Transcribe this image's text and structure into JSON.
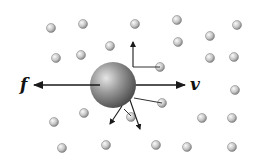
{
  "diagram": {
    "labels": {
      "force": "f",
      "velocity": "v"
    },
    "colors": {
      "background": "#ffffff",
      "arrow": "#1a1a1a",
      "big_particle_light": "#d8d8d8",
      "big_particle_dark": "#555555",
      "small_particle_light": "#f4f4f4",
      "small_particle_dark": "#8a8a8a"
    },
    "big_particle": {
      "cx": 113,
      "cy": 85,
      "r": 23
    },
    "force_arrow": {
      "x1": 100,
      "y1": 85,
      "x2": 34,
      "y2": 85
    },
    "velocity_arrow": {
      "x1": 136,
      "y1": 85,
      "x2": 185,
      "y2": 85
    },
    "collision_arrows": [
      {
        "x1": 133,
        "y1": 67,
        "x2": 133,
        "y2": 42
      },
      {
        "x1": 122,
        "y1": 106,
        "x2": 110,
        "y2": 124
      },
      {
        "x1": 130,
        "y1": 100,
        "x2": 140,
        "y2": 129
      }
    ],
    "collision_lines": [
      {
        "x1": 133,
        "y1": 67,
        "x2": 160,
        "y2": 67
      },
      {
        "x1": 134,
        "y1": 98,
        "x2": 162,
        "y2": 103
      },
      {
        "x1": 124,
        "y1": 109,
        "x2": 131,
        "y2": 116
      }
    ],
    "small_particles": [
      {
        "cx": 51,
        "cy": 28
      },
      {
        "cx": 83,
        "cy": 24
      },
      {
        "cx": 135,
        "cy": 24
      },
      {
        "cx": 177,
        "cy": 20
      },
      {
        "cx": 237,
        "cy": 25
      },
      {
        "cx": 56,
        "cy": 58
      },
      {
        "cx": 81,
        "cy": 55
      },
      {
        "cx": 110,
        "cy": 46
      },
      {
        "cx": 178,
        "cy": 42
      },
      {
        "cx": 210,
        "cy": 36
      },
      {
        "cx": 160,
        "cy": 67
      },
      {
        "cx": 210,
        "cy": 58
      },
      {
        "cx": 234,
        "cy": 57
      },
      {
        "cx": 235,
        "cy": 90
      },
      {
        "cx": 162,
        "cy": 103
      },
      {
        "cx": 131,
        "cy": 117
      },
      {
        "cx": 84,
        "cy": 113
      },
      {
        "cx": 54,
        "cy": 122
      },
      {
        "cx": 202,
        "cy": 118
      },
      {
        "cx": 232,
        "cy": 118
      },
      {
        "cx": 62,
        "cy": 148
      },
      {
        "cx": 106,
        "cy": 145
      },
      {
        "cx": 156,
        "cy": 145
      },
      {
        "cx": 187,
        "cy": 147
      },
      {
        "cx": 232,
        "cy": 147
      }
    ],
    "small_particle_radius": 4.5
  }
}
